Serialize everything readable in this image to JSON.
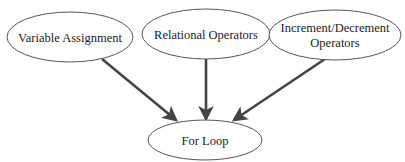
{
  "diagram": {
    "type": "flow",
    "colors": {
      "background": "#ffffff",
      "node_stroke": "#555555",
      "edge": "#444444",
      "text": "#222222"
    },
    "nodes": [
      {
        "id": "variable-assignment",
        "lines": [
          "Variable Assignment"
        ],
        "cx": 70,
        "cy": 37,
        "rx": 63,
        "ry": 25
      },
      {
        "id": "relational-operators",
        "lines": [
          "Relational Operators"
        ],
        "cx": 206,
        "cy": 34,
        "rx": 64,
        "ry": 25
      },
      {
        "id": "increment-decrement-operators",
        "lines": [
          "Increment/Decrement",
          "Operators"
        ],
        "cx": 335,
        "cy": 35,
        "rx": 66,
        "ry": 25
      },
      {
        "id": "for-loop",
        "lines": [
          "For Loop"
        ],
        "cx": 205,
        "cy": 140,
        "rx": 57,
        "ry": 20
      }
    ],
    "edges": [
      {
        "from": "variable-assignment",
        "to": "for-loop",
        "x1": 102,
        "y1": 59,
        "x2": 176,
        "y2": 120
      },
      {
        "from": "relational-operators",
        "to": "for-loop",
        "x1": 206,
        "y1": 59,
        "x2": 206,
        "y2": 119
      },
      {
        "from": "increment-decrement-operators",
        "to": "for-loop",
        "x1": 325,
        "y1": 59,
        "x2": 234,
        "y2": 120
      }
    ]
  }
}
